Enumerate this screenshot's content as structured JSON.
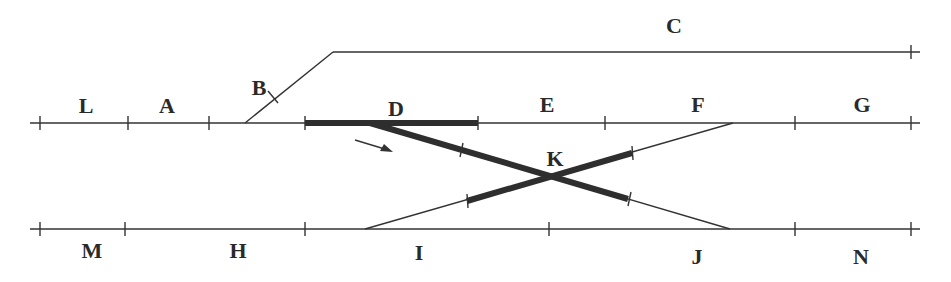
{
  "diagram": {
    "type": "railway track layout",
    "colors": {
      "track": "#333333",
      "occupied_route": "#2e2e2e",
      "label": "#2a2a2a",
      "background": "#ffffff"
    },
    "labels": {
      "L": "L",
      "A": "A",
      "B": "B",
      "C": "C",
      "D": "D",
      "E": "E",
      "F": "F",
      "G": "G",
      "H": "H",
      "I": "I",
      "J": "J",
      "K": "K",
      "M": "M",
      "N": "N"
    },
    "sections": [
      {
        "id": "L",
        "track": "main-upper"
      },
      {
        "id": "A",
        "track": "main-upper"
      },
      {
        "id": "B",
        "track": "branch-to-siding"
      },
      {
        "id": "C",
        "track": "siding-top"
      },
      {
        "id": "D",
        "track": "main-upper",
        "highlighted": true
      },
      {
        "id": "E",
        "track": "main-upper"
      },
      {
        "id": "F",
        "track": "main-upper"
      },
      {
        "id": "G",
        "track": "main-upper"
      },
      {
        "id": "K",
        "track": "diamond-crossover",
        "highlighted": true
      },
      {
        "id": "M",
        "track": "main-lower"
      },
      {
        "id": "H",
        "track": "main-lower"
      },
      {
        "id": "I",
        "track": "main-lower"
      },
      {
        "id": "J",
        "track": "main-lower"
      },
      {
        "id": "N",
        "track": "main-lower"
      }
    ],
    "direction_arrow": "arrow-right-down"
  }
}
